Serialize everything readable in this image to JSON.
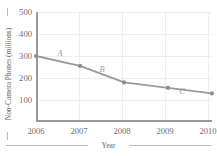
{
  "chart_data": {
    "type": "line",
    "title": "",
    "xlabel": "Year",
    "ylabel": "Non-Camera Phones (millions)",
    "categories": [
      "2006",
      "2007",
      "2008",
      "2009",
      "2010"
    ],
    "x": [
      2006,
      2007,
      2008,
      2009,
      2010
    ],
    "values": [
      300,
      255,
      180,
      155,
      130
    ],
    "series": [
      {
        "name": "Non-Camera Phones",
        "values": [
          300,
          255,
          180,
          155,
          130
        ]
      }
    ],
    "ylim": [
      0,
      500
    ],
    "yticks": [
      100,
      200,
      300,
      400,
      500
    ],
    "ytick_labels": [
      "100",
      "200",
      "300",
      "400",
      "500"
    ],
    "xtick_labels": [
      "2006",
      "2007",
      "2008",
      "2009",
      "2010"
    ],
    "grid": true,
    "legend": "none",
    "annotations": [
      {
        "label": "A",
        "segment": "2006-2007"
      },
      {
        "label": "B",
        "segment": "2007-2008"
      },
      {
        "label": "C",
        "segment": "2009-2010"
      }
    ],
    "colors": {
      "line": "#9a9a9a",
      "marker": "#8e8e8e",
      "grid": "#ededed",
      "axis": "#9a9a9a",
      "text": "#6e6e6e",
      "annotation": "#9d9d9d"
    }
  }
}
